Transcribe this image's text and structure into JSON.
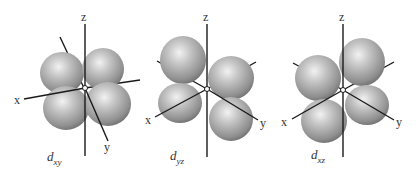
{
  "figure": {
    "type": "d-orbital diagram",
    "lobe_color": "#a9a9a9",
    "lobe_highlight": "#f0f0f0",
    "lobe_shadow": "#6e6e6e",
    "axis_color": "#1a1a1a",
    "orbitals": [
      {
        "name": "d_xy",
        "label_main": "d",
        "label_sub": "xy",
        "axes": {
          "x": "x",
          "y": "y",
          "z": "z"
        }
      },
      {
        "name": "d_yz",
        "label_main": "d",
        "label_sub": "yz",
        "axes": {
          "x": "x",
          "y": "y",
          "z": "z"
        }
      },
      {
        "name": "d_xz",
        "label_main": "d",
        "label_sub": "xz",
        "axes": {
          "x": "x",
          "y": "y",
          "z": "z"
        }
      }
    ]
  }
}
